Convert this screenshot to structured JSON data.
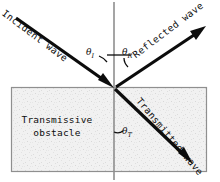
{
  "diagram": {
    "title_present": false,
    "labels": {
      "incident_wave": "Incident wave",
      "reflected_wave": "Reflected wave",
      "transmitted_wave": "Transmitted wave",
      "obstacle_line1": "Transmissive",
      "obstacle_line2": "obstacle",
      "theta_incident_symbol": "θ",
      "theta_incident_sub": "I",
      "theta_reflected_symbol": "θ",
      "theta_reflected_sub": "R",
      "theta_transmitted_symbol": "θ",
      "theta_transmitted_sub": "T"
    },
    "colors": {
      "stroke": "#0c0c0c",
      "background": "#ffffff",
      "obstacle_fill": "#f0f0f0",
      "obstacle_border": "#8a8a8a",
      "normal_line": "#8a8a8a"
    },
    "geometry": {
      "interface_point_x": 114,
      "interface_point_y": 88,
      "normal_x": 114,
      "obstacle_box": {
        "x": 11,
        "y": 87,
        "width": 196,
        "height": 85
      }
    }
  }
}
